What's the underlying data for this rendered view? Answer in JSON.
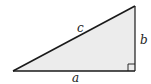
{
  "diagram": {
    "type": "right-triangle",
    "fill_color": "#ececec",
    "stroke_color": "#1a1a1a",
    "vertices": {
      "left": [
        13,
        71
      ],
      "right_angle": [
        135,
        71
      ],
      "top": [
        135,
        6
      ]
    },
    "labels": {
      "hypotenuse": "c",
      "vertical_leg": "b",
      "horizontal_leg": "a"
    },
    "right_angle_marker": true
  }
}
